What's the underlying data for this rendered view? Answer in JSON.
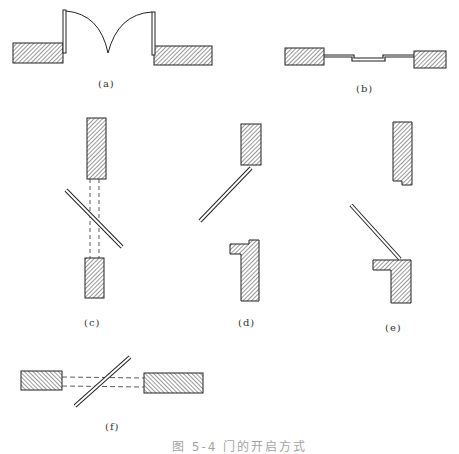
{
  "figure": {
    "panels": [
      {
        "id": "a",
        "label": "(a)",
        "description": "double swing door with arcs"
      },
      {
        "id": "b",
        "label": "(b)",
        "description": "sliding door"
      },
      {
        "id": "c",
        "label": "(c)",
        "description": "pivot door with dashed projection"
      },
      {
        "id": "d",
        "label": "(d)",
        "description": "hinged door with rebated jamb"
      },
      {
        "id": "e",
        "label": "(e)",
        "description": "hinged door with rebated jambs"
      },
      {
        "id": "f",
        "label": "(f)",
        "description": "horizontal pivot door with dashed projection"
      }
    ],
    "caption": "图 5-4  门的开启方式"
  },
  "colors": {
    "stroke": "#222222",
    "hatch": "#444444",
    "fill": "#ffffff"
  }
}
